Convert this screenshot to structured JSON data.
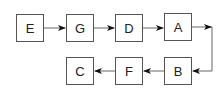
{
  "diagram": {
    "type": "flow",
    "nodes": [
      {
        "id": "E",
        "label": "E",
        "x": 16,
        "y": 14
      },
      {
        "id": "G",
        "label": "G",
        "x": 66,
        "y": 14
      },
      {
        "id": "D",
        "label": "D",
        "x": 115,
        "y": 14
      },
      {
        "id": "A",
        "label": "A",
        "x": 164,
        "y": 13
      },
      {
        "id": "B",
        "label": "B",
        "x": 164,
        "y": 57
      },
      {
        "id": "F",
        "label": "F",
        "x": 115,
        "y": 57
      },
      {
        "id": "C",
        "label": "C",
        "x": 66,
        "y": 57
      }
    ],
    "edges": [
      {
        "from": "E",
        "to": "G"
      },
      {
        "from": "G",
        "to": "D"
      },
      {
        "from": "D",
        "to": "A"
      },
      {
        "from": "A",
        "to": "B"
      },
      {
        "from": "B",
        "to": "F"
      },
      {
        "from": "F",
        "to": "C"
      }
    ],
    "colors": {
      "stroke": "#555555",
      "arrow": "#111111",
      "text": "#222222"
    }
  }
}
